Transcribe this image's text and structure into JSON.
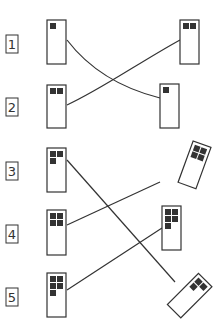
{
  "diagram": {
    "title": "",
    "ink_color": "#333333",
    "rows": [
      {
        "label": "1",
        "left_squares": 1,
        "right_squares": 2,
        "right_tilted": false
      },
      {
        "label": "2",
        "left_squares": 2,
        "right_squares": 1,
        "right_tilted": false
      },
      {
        "label": "3",
        "left_squares": 3,
        "right_squares": 4,
        "right_tilted": true
      },
      {
        "label": "4",
        "left_squares": 4,
        "right_squares": 5,
        "right_tilted": false
      },
      {
        "label": "5",
        "left_squares": 5,
        "right_squares": 3,
        "right_tilted": true
      }
    ],
    "connections": [
      {
        "from": "1",
        "to_right_squares": 1
      },
      {
        "from": "2",
        "to_right_squares": 2
      },
      {
        "from": "3",
        "to_right_squares": 3
      },
      {
        "from": "4",
        "to_right_squares": 4
      },
      {
        "from": "5",
        "to_right_squares": 5
      }
    ]
  }
}
